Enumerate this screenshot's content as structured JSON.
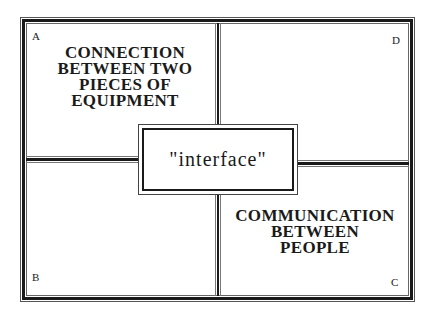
{
  "diagram": {
    "center_label": "\"interface\"",
    "quadrants": {
      "A": {
        "corner_label": "A",
        "lines": [
          "CONNECTION",
          "BETWEEN TWO",
          "PIECES OF",
          "EQUIPMENT"
        ]
      },
      "B": {
        "corner_label": "B",
        "lines": []
      },
      "C": {
        "corner_label": "C",
        "lines": [
          "COMMUNICATION",
          "BETWEEN",
          "PEOPLE"
        ]
      },
      "D": {
        "corner_label": "D",
        "lines": []
      }
    }
  }
}
